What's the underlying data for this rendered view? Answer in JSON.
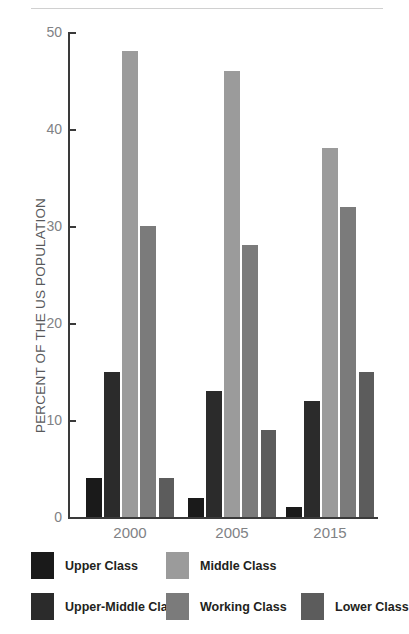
{
  "chart_data": {
    "type": "bar",
    "title": "",
    "subtitle": "",
    "xlabel": "",
    "ylabel": "PERCENT OF THE US POPULATION",
    "categories": [
      "2000",
      "2005",
      "2015"
    ],
    "ylim": [
      0,
      50
    ],
    "yticks": [
      0,
      10,
      20,
      30,
      40,
      50
    ],
    "ytick_labels": [
      "0",
      "10",
      "20",
      "30",
      "40",
      "50"
    ],
    "grid": false,
    "legend_position": "bottom",
    "series": [
      {
        "name": "Upper Class",
        "color": "#1a1a1a",
        "values": [
          4,
          2,
          1
        ]
      },
      {
        "name": "Upper-Middle Class",
        "color": "#2b2b2b",
        "values": [
          15,
          13,
          12
        ]
      },
      {
        "name": "Middle Class",
        "color": "#9b9b9b",
        "values": [
          48,
          46,
          38
        ]
      },
      {
        "name": "Working Class",
        "color": "#7b7b7b",
        "values": [
          30,
          28,
          32
        ]
      },
      {
        "name": "Lower Class",
        "color": "#5c5c5c",
        "values": [
          4,
          9,
          15
        ]
      }
    ]
  },
  "legend": {
    "items": [
      {
        "label": "Upper Class",
        "color": "#1a1a1a"
      },
      {
        "label": "Middle Class",
        "color": "#9b9b9b"
      },
      {
        "label": "Upper-Middle Class",
        "color": "#2b2b2b"
      },
      {
        "label": "Working Class",
        "color": "#7b7b7b"
      },
      {
        "label": "Lower Class",
        "color": "#5c5c5c"
      }
    ]
  },
  "axis": {
    "y_title": "PERCENT OF THE US POPULATION",
    "y_labels": [
      "50",
      "40",
      "30",
      "20",
      "10",
      "0"
    ],
    "x_labels": [
      "2000",
      "2005",
      "2015"
    ]
  }
}
